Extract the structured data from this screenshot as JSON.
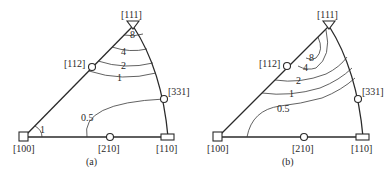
{
  "figure": {
    "panels": [
      {
        "caption": "(a)",
        "poles": {
          "p111": "[111]",
          "p112": "[112]",
          "p331": "[331]",
          "p100": "[100]",
          "p210": "[210]",
          "p110": "[110]"
        },
        "contours": [
          "8",
          "4",
          "2",
          "1",
          "0.5",
          "1"
        ]
      },
      {
        "caption": "(b)",
        "poles": {
          "p111": "[111]",
          "p112": "[112]",
          "p331": "[331]",
          "p100": "[100]",
          "p210": "[210]",
          "p110": "[110]"
        },
        "contours": [
          "8",
          "4",
          "2",
          "1",
          "0.5"
        ]
      }
    ]
  }
}
